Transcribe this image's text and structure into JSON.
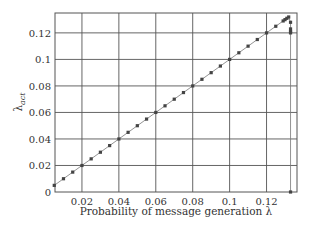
{
  "chart_data": {
    "type": "line",
    "title": "",
    "xlabel": "Probability of message generation λ",
    "ylabel": "λ_act",
    "ylabel_main": "λ",
    "ylabel_sub": "act",
    "xlim": [
      0.0054,
      0.1365
    ],
    "ylim": [
      0,
      0.135
    ],
    "grid": true,
    "legend": null,
    "x_ticks": [
      0.02,
      0.04,
      0.06,
      0.08,
      0.1,
      0.12
    ],
    "x_tick_labels": [
      "0.02",
      "0.04",
      "0.06",
      "0.08",
      "0.1",
      "0.12"
    ],
    "y_ticks": [
      0,
      0.02,
      0.04,
      0.06,
      0.08,
      0.1,
      0.12
    ],
    "y_tick_labels": [
      "0",
      "0.02",
      "0.04",
      "0.06",
      "0.08",
      "0.1",
      "0.12"
    ],
    "series": [
      {
        "name": "λ_act",
        "color": "#444444",
        "marker": "square",
        "x": [
          0.005,
          0.01,
          0.015,
          0.02,
          0.025,
          0.03,
          0.035,
          0.04,
          0.045,
          0.05,
          0.055,
          0.06,
          0.065,
          0.07,
          0.075,
          0.08,
          0.085,
          0.09,
          0.095,
          0.1,
          0.105,
          0.11,
          0.115,
          0.12,
          0.125,
          0.129,
          0.13,
          0.131,
          0.132,
          0.133,
          0.133,
          0.133,
          0.133,
          0.133
        ],
        "y": [
          0.005,
          0.01,
          0.015,
          0.02,
          0.025,
          0.03,
          0.035,
          0.04,
          0.045,
          0.05,
          0.055,
          0.06,
          0.065,
          0.07,
          0.075,
          0.08,
          0.085,
          0.09,
          0.095,
          0.1,
          0.105,
          0.11,
          0.115,
          0.12,
          0.125,
          0.129,
          0.13,
          0.131,
          0.132,
          0.128,
          0.123,
          0.121,
          0.12,
          0.0
        ]
      }
    ]
  }
}
